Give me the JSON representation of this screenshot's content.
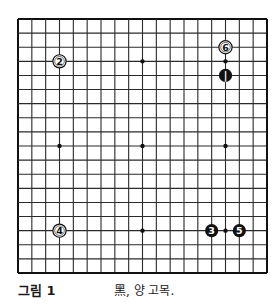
{
  "board": {
    "size": 19,
    "left": 18,
    "top": 19,
    "right": 267,
    "bottom": 273,
    "line_color": "#2a2a2a",
    "border_color": "#111111",
    "star_points": [
      [
        3,
        3
      ],
      [
        9,
        3
      ],
      [
        15,
        3
      ],
      [
        3,
        9
      ],
      [
        9,
        9
      ],
      [
        15,
        9
      ],
      [
        3,
        15
      ],
      [
        9,
        15
      ],
      [
        15,
        15
      ]
    ],
    "stones": [
      {
        "move": 1,
        "color": "black",
        "col": 15,
        "row": 4
      },
      {
        "move": 2,
        "color": "white",
        "col": 3,
        "row": 3
      },
      {
        "move": 3,
        "color": "black",
        "col": 14,
        "row": 15
      },
      {
        "move": 4,
        "color": "white",
        "col": 3,
        "row": 15
      },
      {
        "move": 5,
        "color": "black",
        "col": 16,
        "row": 15
      },
      {
        "move": 6,
        "color": "white",
        "col": 15,
        "row": 2
      }
    ],
    "colors": {
      "black_stone": "#111111",
      "white_stone": "#ffffff",
      "black_label": "#ffffff",
      "white_label": "#111111"
    }
  },
  "caption": {
    "label": "그림 1",
    "text": "黑, 양 고목."
  }
}
